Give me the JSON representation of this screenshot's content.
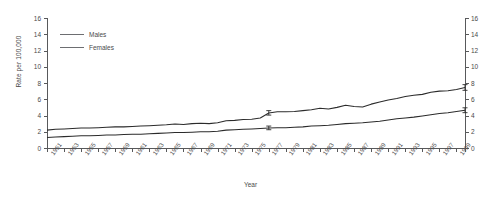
{
  "cut_title_fragment": "",
  "axes": {
    "ylabel": "Rate per 100,000",
    "xlabel": "Year",
    "yticks": [
      0,
      2,
      4,
      6,
      8,
      10,
      12,
      14,
      16
    ],
    "ylim": [
      0,
      16
    ],
    "xlim": [
      1951,
      2000
    ],
    "xticks": [
      1951,
      1953,
      1955,
      1957,
      1959,
      1961,
      1963,
      1965,
      1967,
      1969,
      1971,
      1973,
      1975,
      1977,
      1979,
      1981,
      1983,
      1985,
      1987,
      1989,
      1991,
      1993,
      1995,
      1997,
      1999
    ]
  },
  "legend": {
    "position": "top-left",
    "items": [
      {
        "label": "Males",
        "color": "#6d6e71"
      },
      {
        "label": "Females",
        "color": "#6d6e71"
      }
    ]
  },
  "chart_data": {
    "type": "line",
    "title": "",
    "xlabel": "Year",
    "ylabel": "Rate per 100,000",
    "ylim": [
      0,
      16
    ],
    "xlim": [
      1951,
      2000
    ],
    "grid": false,
    "legend_position": "top-left",
    "secondary_y_axis": true,
    "x": [
      1951,
      1952,
      1953,
      1954,
      1955,
      1956,
      1957,
      1958,
      1959,
      1960,
      1961,
      1962,
      1963,
      1964,
      1965,
      1966,
      1967,
      1968,
      1969,
      1970,
      1971,
      1972,
      1973,
      1974,
      1975,
      1976,
      1977,
      1978,
      1979,
      1980,
      1981,
      1982,
      1983,
      1984,
      1985,
      1986,
      1987,
      1988,
      1989,
      1990,
      1991,
      1992,
      1993,
      1994,
      1995,
      1996,
      1997,
      1998,
      1999,
      2000
    ],
    "series": [
      {
        "name": "Males",
        "color": "#2b2b2b",
        "values": [
          2.2,
          2.3,
          2.35,
          2.4,
          2.45,
          2.45,
          2.5,
          2.55,
          2.6,
          2.6,
          2.65,
          2.7,
          2.75,
          2.8,
          2.85,
          2.95,
          2.9,
          3.0,
          3.05,
          3.0,
          3.1,
          3.35,
          3.4,
          3.5,
          3.55,
          3.7,
          4.3,
          4.45,
          4.45,
          4.5,
          4.6,
          4.7,
          4.9,
          4.8,
          5.0,
          5.25,
          5.1,
          5.05,
          5.4,
          5.65,
          5.9,
          6.1,
          6.35,
          6.5,
          6.6,
          6.85,
          7.0,
          7.05,
          7.2,
          7.45
        ],
        "error_bars": [
          {
            "x": 1977,
            "value": 4.3,
            "low": 4.05,
            "high": 4.6
          },
          {
            "x": 2000,
            "value": 7.45,
            "low": 7.1,
            "high": 7.8
          }
        ]
      },
      {
        "name": "Females",
        "color": "#2b2b2b",
        "values": [
          1.3,
          1.35,
          1.4,
          1.45,
          1.5,
          1.5,
          1.55,
          1.6,
          1.6,
          1.65,
          1.7,
          1.7,
          1.75,
          1.8,
          1.85,
          1.9,
          1.9,
          1.95,
          2.0,
          2.0,
          2.05,
          2.2,
          2.25,
          2.3,
          2.35,
          2.4,
          2.45,
          2.5,
          2.5,
          2.55,
          2.6,
          2.7,
          2.75,
          2.8,
          2.9,
          3.0,
          3.05,
          3.1,
          3.2,
          3.3,
          3.45,
          3.6,
          3.7,
          3.8,
          3.95,
          4.1,
          4.25,
          4.35,
          4.5,
          4.65
        ],
        "error_bars": [
          {
            "x": 1977,
            "value": 2.45,
            "low": 2.25,
            "high": 2.7
          },
          {
            "x": 2000,
            "value": 4.65,
            "low": 4.35,
            "high": 4.95
          }
        ]
      }
    ]
  }
}
